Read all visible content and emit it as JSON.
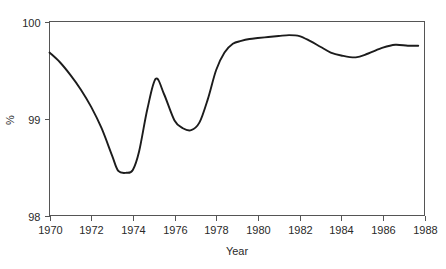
{
  "chart_data": {
    "type": "line",
    "title": "",
    "xlabel": "Year",
    "ylabel": "%",
    "xlim": [
      1970,
      1988
    ],
    "ylim": [
      98,
      100
    ],
    "grid": false,
    "legend": null,
    "x_ticks": [
      1970,
      1972,
      1974,
      1976,
      1978,
      1980,
      1982,
      1984,
      1986,
      1988
    ],
    "x_tick_labels": [
      "1970",
      "1972",
      "1974",
      "1976",
      "1978",
      "1980",
      "1982",
      "1984",
      "1986",
      "1988"
    ],
    "y_ticks": [
      98,
      99,
      100
    ],
    "y_tick_labels": [
      "98",
      "99",
      "100"
    ],
    "line_color": "#1c1c1c",
    "axis_color": "#555555",
    "series": [
      {
        "name": "percent",
        "x": [
          1970.0,
          1970.5,
          1971.0,
          1971.5,
          1972.0,
          1972.5,
          1973.0,
          1973.3,
          1973.7,
          1974.0,
          1974.3,
          1974.7,
          1975.1,
          1975.5,
          1976.0,
          1976.4,
          1976.8,
          1977.2,
          1977.6,
          1978.0,
          1978.4,
          1978.8,
          1979.2,
          1979.6,
          1980.0,
          1980.5,
          1981.0,
          1981.5,
          1982.0,
          1982.5,
          1983.0,
          1983.5,
          1984.0,
          1984.7,
          1985.3,
          1986.0,
          1986.6,
          1987.2,
          1987.7
        ],
        "y": [
          99.68,
          99.58,
          99.45,
          99.3,
          99.12,
          98.9,
          98.62,
          98.46,
          98.44,
          98.47,
          98.66,
          99.1,
          99.41,
          99.25,
          98.98,
          98.9,
          98.88,
          98.96,
          99.2,
          99.5,
          99.68,
          99.77,
          99.8,
          99.82,
          99.83,
          99.84,
          99.85,
          99.86,
          99.85,
          99.8,
          99.74,
          99.68,
          99.65,
          99.63,
          99.67,
          99.73,
          99.76,
          99.75,
          99.75
        ]
      }
    ]
  },
  "axis_labels": {
    "x_title": "Year",
    "y_title": "%"
  }
}
